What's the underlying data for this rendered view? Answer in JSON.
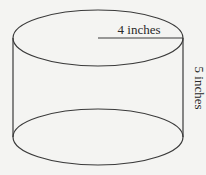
{
  "diagram": {
    "type": "cylinder",
    "radius_label": "4 inches",
    "height_label": "5 inches",
    "colors": {
      "stroke": "#3a3a3a",
      "background": "#f4f4f2",
      "text": "#2a2a2a"
    }
  }
}
